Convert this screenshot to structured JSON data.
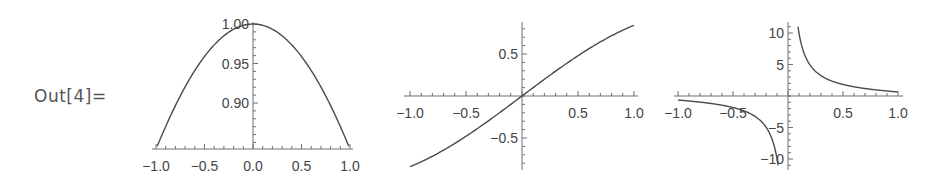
{
  "output_label": "Out[4]=",
  "colors": {
    "curve": "#4a4a4a",
    "axis": "#6e6e6e",
    "label": "#444444"
  },
  "chart_data": [
    {
      "type": "line",
      "title": "",
      "function": "sin(x)/x",
      "xlabel": "",
      "ylabel": "",
      "xlim": [
        -1,
        1
      ],
      "ylim": [
        0.8415,
        1.0
      ],
      "x_ticks": [
        "-1.0",
        "-0.5",
        "0.0",
        "0.5",
        "1.0"
      ],
      "y_ticks": [
        "0.90",
        "0.95",
        "1.00"
      ],
      "x": [
        -1.0,
        -0.75,
        -0.5,
        -0.25,
        0.0,
        0.25,
        0.5,
        0.75,
        1.0
      ],
      "y": [
        0.841,
        0.909,
        0.959,
        0.99,
        1.0,
        0.99,
        0.959,
        0.909,
        0.841
      ],
      "grid": false,
      "box": {
        "left": 153,
        "right": 352,
        "x0px": 253,
        "y_axis_px": 149,
        "unit_x": 97,
        "y_top_val": 1.0,
        "y_top_px": 24,
        "px_per_y": 780
      }
    },
    {
      "type": "line",
      "title": "",
      "function": "sin(x)",
      "xlabel": "",
      "ylabel": "",
      "xlim": [
        -1,
        1
      ],
      "ylim": [
        -0.85,
        0.85
      ],
      "x_ticks": [
        "-1.0",
        "-0.5",
        "0.5",
        "1.0"
      ],
      "y_ticks": [
        "0.5",
        "-0.5"
      ],
      "x": [
        -1.0,
        -0.75,
        -0.5,
        -0.25,
        0.0,
        0.25,
        0.5,
        0.75,
        1.0
      ],
      "y": [
        -0.841,
        -0.682,
        -0.479,
        -0.247,
        0.0,
        0.247,
        0.479,
        0.682,
        0.841
      ],
      "grid": false
    },
    {
      "type": "line",
      "title": "",
      "function": "cot(x)",
      "xlabel": "",
      "ylabel": "",
      "xlim": [
        -1,
        1
      ],
      "ylim": [
        -11,
        11
      ],
      "x_ticks": [
        "-1.0",
        "-0.5",
        "0.5",
        "1.0"
      ],
      "y_ticks": [
        "10",
        "5",
        "-5",
        "-10"
      ],
      "x": [
        -1.0,
        -0.75,
        -0.5,
        -0.25,
        -0.1,
        0.1,
        0.25,
        0.5,
        0.75,
        1.0
      ],
      "y": [
        -0.642,
        -1.074,
        -1.83,
        -3.916,
        -9.967,
        9.967,
        3.916,
        1.83,
        1.074,
        0.642
      ],
      "grid": false
    }
  ]
}
